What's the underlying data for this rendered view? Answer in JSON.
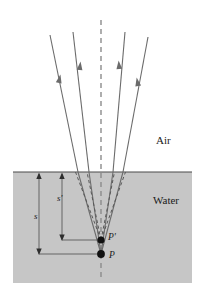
{
  "figure": {
    "media": {
      "upper_label": "Air",
      "lower_label": "Water"
    },
    "points": {
      "object_label": "P",
      "image_label": "P'"
    },
    "dimensions": {
      "object_distance_label": "s",
      "image_distance_label": "s'"
    },
    "colors": {
      "water_fill": "#c6c6c6",
      "surface_line": "#4a4a4a",
      "ray_stroke": "#6b6b6b",
      "axis_dashed": "#8c8c8c",
      "dot_fill": "#111111",
      "text": "#1a1a1a",
      "dim_line": "#5a5a5a",
      "background": "#ffffff"
    },
    "geometry": {
      "surface_y": 172,
      "water_left": 13,
      "water_right": 192,
      "water_bottom": 283,
      "axis_x": 101,
      "object_point": [
        101,
        254
      ],
      "image_point": [
        101,
        240
      ],
      "ray_tops": [
        [
          50,
          35
        ],
        [
          73,
          32
        ],
        [
          125,
          32
        ],
        [
          148,
          37
        ]
      ],
      "ray_surface_x": [
        78,
        89,
        113,
        123
      ],
      "dim_s_x": 39,
      "dim_sprime_x": 62
    }
  }
}
